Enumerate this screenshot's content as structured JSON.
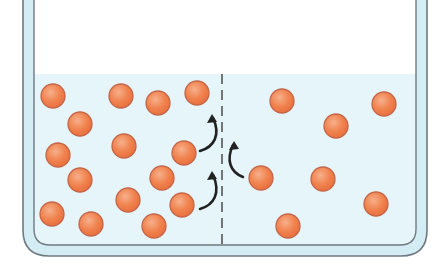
{
  "diagram": {
    "type": "diffusion-across-membrane",
    "colors": {
      "background": "#ffffff",
      "water": "#e6f5f9",
      "wall_fill": "#d4edf5",
      "wall_stroke": "#6f7a80",
      "particle_fill": "#f0834f",
      "particle_highlight": "#f7b08c",
      "particle_stroke": "#c4674a",
      "membrane": "#333333",
      "arrow": "#222222"
    },
    "container": {
      "outer": {
        "x": 23,
        "width": 404,
        "bottom": 256,
        "radius": 26
      },
      "inner": {
        "x": 34,
        "width": 382,
        "bottom": 245,
        "radius": 16
      },
      "water_level_y": 74
    },
    "membrane": {
      "x": 222,
      "y_top": 74,
      "y_bottom": 245,
      "style": "dashed"
    },
    "particles_left": [
      {
        "x": 53,
        "y": 96
      },
      {
        "x": 121,
        "y": 96
      },
      {
        "x": 158,
        "y": 103
      },
      {
        "x": 197,
        "y": 93
      },
      {
        "x": 80,
        "y": 124
      },
      {
        "x": 124,
        "y": 146
      },
      {
        "x": 58,
        "y": 155
      },
      {
        "x": 184,
        "y": 153
      },
      {
        "x": 80,
        "y": 180
      },
      {
        "x": 162,
        "y": 178
      },
      {
        "x": 128,
        "y": 200
      },
      {
        "x": 182,
        "y": 205
      },
      {
        "x": 52,
        "y": 214
      },
      {
        "x": 91,
        "y": 224
      },
      {
        "x": 154,
        "y": 226
      }
    ],
    "particles_right": [
      {
        "x": 282,
        "y": 101
      },
      {
        "x": 336,
        "y": 126
      },
      {
        "x": 384,
        "y": 104
      },
      {
        "x": 261,
        "y": 178
      },
      {
        "x": 323,
        "y": 179
      },
      {
        "x": 376,
        "y": 204
      },
      {
        "x": 288,
        "y": 226
      }
    ],
    "particle_radius": 12,
    "arrows": [
      {
        "from": "left",
        "path": "M200 151 C 214 147, 221 135, 213 118",
        "tip": [
          212,
          114
        ]
      },
      {
        "from": "left",
        "path": "M200 209 C 214 205, 221 193, 213 175",
        "tip": [
          212,
          171
        ]
      },
      {
        "from": "right",
        "path": "M243 177 C 230 172, 226 160, 233 145",
        "tip": [
          234,
          141
        ]
      }
    ],
    "labels": []
  }
}
